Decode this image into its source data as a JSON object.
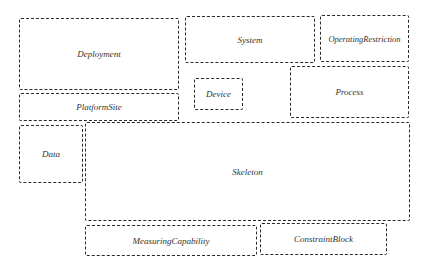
{
  "diagram": {
    "type": "block-layout",
    "line_style": "dashed",
    "line_color": "#2a2a2a",
    "text_color": "#333333",
    "blocks": [
      {
        "id": "deployment",
        "label": "Deployment",
        "x": 19,
        "y": 18,
        "w": 160,
        "h": 72
      },
      {
        "id": "platformsite",
        "label": "PlatformSite",
        "x": 19,
        "y": 93,
        "w": 160,
        "h": 28
      },
      {
        "id": "system",
        "label": "System",
        "x": 185,
        "y": 16,
        "w": 130,
        "h": 47
      },
      {
        "id": "operatingrestriction",
        "label": "OperatingRestriction",
        "x": 320,
        "y": 15,
        "w": 89,
        "h": 47
      },
      {
        "id": "device",
        "label": "Device",
        "x": 194,
        "y": 78,
        "w": 49,
        "h": 32
      },
      {
        "id": "process",
        "label": "Process",
        "x": 290,
        "y": 66,
        "w": 119,
        "h": 52
      },
      {
        "id": "data",
        "label": "Data",
        "x": 19,
        "y": 125,
        "w": 64,
        "h": 58
      },
      {
        "id": "skeleton",
        "label": "Skeleton",
        "x": 85,
        "y": 122,
        "w": 325,
        "h": 99
      },
      {
        "id": "measuringcapability",
        "label": "MeasuringCapability",
        "x": 85,
        "y": 225,
        "w": 172,
        "h": 31
      },
      {
        "id": "constraintblock",
        "label": "ConstraintBlock",
        "x": 260,
        "y": 223,
        "w": 127,
        "h": 32
      }
    ]
  }
}
